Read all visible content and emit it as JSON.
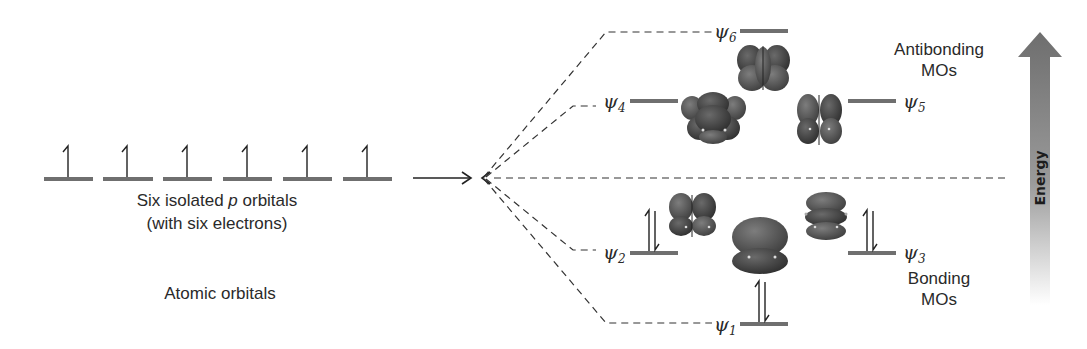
{
  "diagram": {
    "atomic_section": {
      "caption_line1_prefix": "Six isolated ",
      "caption_line1_italic": "p",
      "caption_line1_suffix": " orbitals",
      "caption_line2": "(with six electrons)",
      "section_label": "Atomic orbitals",
      "orbital_count": 6,
      "electrons_per_orbital": 1
    },
    "molecular_orbitals": [
      {
        "id": "psi6",
        "symbol": "ψ",
        "subscript": "6",
        "type": "antibonding",
        "electrons": 0
      },
      {
        "id": "psi4",
        "symbol": "ψ",
        "subscript": "4",
        "type": "antibonding",
        "electrons": 0
      },
      {
        "id": "psi5",
        "symbol": "ψ",
        "subscript": "5",
        "type": "antibonding",
        "electrons": 0
      },
      {
        "id": "psi2",
        "symbol": "ψ",
        "subscript": "2",
        "type": "bonding",
        "electrons": 2
      },
      {
        "id": "psi3",
        "symbol": "ψ",
        "subscript": "3",
        "type": "bonding",
        "electrons": 2
      },
      {
        "id": "psi1",
        "symbol": "ψ",
        "subscript": "1",
        "type": "bonding",
        "electrons": 2
      }
    ],
    "labels": {
      "antibonding_line1": "Antibonding",
      "antibonding_line2": "MOs",
      "bonding_line1": "Bonding",
      "bonding_line2": "MOs",
      "energy_axis": "Energy"
    },
    "colors": {
      "level_bar": "#6f6f6f",
      "lobe_dark": "#3a3a3a",
      "lobe_mid": "#5e5e5e",
      "energy_arrow_top": "#6e6e6e",
      "energy_arrow_bottom": "#ffffff"
    }
  }
}
